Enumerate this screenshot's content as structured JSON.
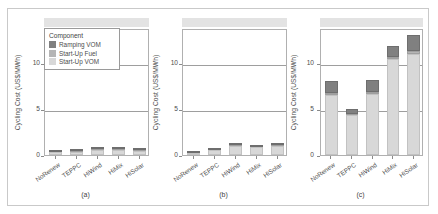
{
  "figure": {
    "ylabel": "Cycling Cost (US$/MWh)",
    "legend_title": "Component"
  },
  "legend": {
    "items": [
      {
        "label": "Ramping VOM",
        "color": "#808080",
        "key": "vom"
      },
      {
        "label": "Start-Up Fuel",
        "color": "#b5b5b5",
        "key": "fuel"
      },
      {
        "label": "Start-Up VOM",
        "color": "#d8d8d8",
        "key": "sup"
      }
    ]
  },
  "axis": {
    "yticks": [
      "0",
      "5",
      "10"
    ],
    "ytick_values": [
      0,
      5,
      10
    ],
    "ylim": [
      0,
      13.8
    ],
    "categories": [
      "NoRenew",
      "TEPPC",
      "HiWind",
      "HiMix",
      "HiSolar"
    ]
  },
  "captions": [
    "(a)",
    "(b)",
    "(c)"
  ],
  "chart_data": {
    "type": "bar",
    "title": "",
    "xlabel": "",
    "ylabel": "Cycling Cost (US$/MWh)",
    "ylim": [
      0,
      13.8
    ],
    "grid": true,
    "legend_position": "inside-top-left",
    "stacked": true,
    "categories": [
      "NoRenew",
      "TEPPC",
      "HiWind",
      "HiMix",
      "HiSolar"
    ],
    "panels": [
      {
        "caption": "(a)",
        "series": [
          {
            "name": "Start-Up VOM",
            "values": [
              0.32,
              0.35,
              0.58,
              0.55,
              0.48
            ]
          },
          {
            "name": "Start-Up Fuel",
            "values": [
              0.05,
              0.05,
              0.08,
              0.08,
              0.07
            ]
          },
          {
            "name": "Ramping VOM",
            "values": [
              0.13,
              0.14,
              0.22,
              0.21,
              0.18
            ]
          }
        ],
        "totals": [
          0.5,
          0.54,
          0.88,
          0.84,
          0.73
        ]
      },
      {
        "caption": "(b)",
        "series": [
          {
            "name": "Start-Up VOM",
            "values": [
              0.18,
              0.52,
              0.95,
              0.82,
              1.02
            ]
          },
          {
            "name": "Start-Up Fuel",
            "values": [
              0.02,
              0.06,
              0.1,
              0.09,
              0.11
            ]
          },
          {
            "name": "Ramping VOM",
            "values": [
              0.03,
              0.08,
              0.13,
              0.11,
              0.14
            ]
          }
        ],
        "totals": [
          0.23,
          0.66,
          1.18,
          1.02,
          1.27
        ]
      },
      {
        "caption": "(c)",
        "series": [
          {
            "name": "Start-Up VOM",
            "values": [
              6.5,
              4.3,
              6.6,
              10.4,
              11.0
            ]
          },
          {
            "name": "Start-Up Fuel",
            "values": [
              0.2,
              0.15,
              0.2,
              0.3,
              0.3
            ]
          },
          {
            "name": "Ramping VOM",
            "values": [
              1.3,
              0.6,
              1.3,
              1.2,
              1.7
            ]
          }
        ],
        "totals": [
          8.0,
          5.05,
          8.1,
          11.9,
          13.0
        ]
      }
    ]
  }
}
